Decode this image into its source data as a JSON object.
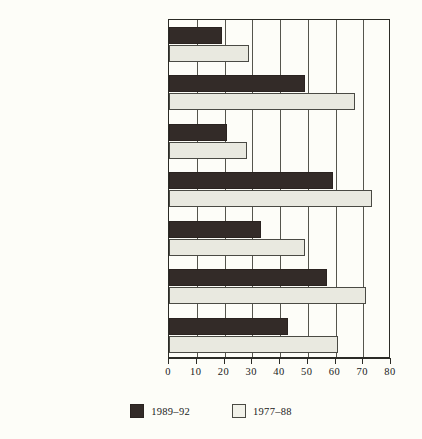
{
  "chart_data": {
    "type": "bar",
    "orientation": "horizontal",
    "title": "",
    "subtitle": "",
    "xlabel": "",
    "ylabel": "",
    "xlim": [
      0,
      80
    ],
    "ylim": null,
    "grid": true,
    "legend_position": "bottom-center",
    "xticks": [
      "0",
      "10",
      "20",
      "30",
      "40",
      "50",
      "60",
      "70",
      "80"
    ],
    "xtick_values": [
      0,
      10,
      20,
      30,
      40,
      50,
      60,
      70,
      80
    ],
    "categories": [
      "Black men",
      "White men",
      "Men with poor parents",
      "Men with affluent parents",
      "Men without college",
      "Men with some college",
      "All men turning 30"
    ],
    "category_footnotes": [
      "",
      "",
      "a",
      "b",
      "",
      "",
      ""
    ],
    "series": [
      {
        "name": "1989–92",
        "color": "#332b28",
        "values": [
          19,
          49,
          21,
          59,
          33,
          57,
          43
        ]
      },
      {
        "name": "1977–88",
        "color": "#e9e9e0",
        "values": [
          29,
          67,
          28,
          73,
          49,
          71,
          61
        ]
      }
    ]
  },
  "legend": {
    "items": [
      {
        "label": "1989–92",
        "swatch": "dark"
      },
      {
        "label": "1977–88",
        "swatch": "light"
      }
    ]
  },
  "colors": {
    "background": "#fdfdf8",
    "axis": "#2b2b26",
    "grid": "#55554d",
    "series_dark": "#332b28",
    "series_light": "#e9e9e0"
  }
}
